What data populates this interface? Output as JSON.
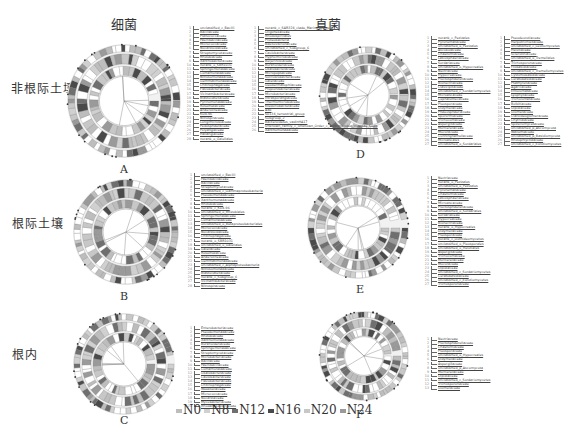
{
  "figure": {
    "column_titles": [
      "细菌",
      "真菌"
    ],
    "row_labels": [
      "非根际土壤",
      "根际土壤",
      "根内"
    ],
    "panels": [
      {
        "letter": "A",
        "row": 0,
        "col": 0,
        "legend_columns": [
          [
            "unclassified_c_Bacilli",
            "Bacillaceae",
            "Planococcaceae",
            "Paenibacillaceae",
            "Micrococcaceae",
            "Nocardioidaceae",
            "Streptomycetaceae",
            "Rhizobiaceae",
            "Xanthobacteraceae",
            "norank_o_SBR1031",
            "Sphingomonadaceae",
            "Comamonadaceae",
            "Nitrosomonadaceae",
            "Gemmatimonadaceae",
            "Chitinophagaceae",
            "Flavobacteriaceae",
            "Vicinamibacteraceae",
            "Blastocatellaceae",
            "Pyrinomonadaceae",
            "Roseiflexaceae",
            "Anaerolineaceae",
            "KD4-96",
            "Nitrospiraceae",
            "Longimicrobiaceae",
            "Pedosphaeraceae",
            "Polyangiaceae",
            "Haliangiaceae",
            "norank_o_Gaiellales"
          ],
          [
            "norank_c_SAR324_clade_Marine_group_B",
            "Oligoflexaceae",
            "Rhodospirillales",
            "Proteobacteria",
            "Bdellovibrionaceae",
            "unclassified_c_Subgroup_6",
            "Caulobacteraceae",
            "Hyphomicrobiaceae",
            "Beijerinckiaceae",
            "Burkholderiaceae",
            "Oxalobacteraceae",
            "Micropepsaceae",
            "Solirubrobacteraceae",
            "Gaiellaceae",
            "Geodermatophilaceae",
            "Propionibacteriaceae",
            "Microbacteriaceae",
            "Intrasporangiaceae",
            "Thermomicrobiaceae",
            "Ktedonobacteraceae",
            "A4b",
            "S0134_terrestrial_group",
            "Subgroup_2",
            "Bacteroidetes_vadinHA17",
            "Unknown_Family_c_Unknown_Order_c_Tectomicrobia_Incertae_Sedis",
            "Xanthomonadaceae"
          ]
        ]
      },
      {
        "letter": "B",
        "row": 1,
        "col": 0,
        "legend_columns": [
          [
            "unclassified_c_Bacilli",
            "Paenibacillaceae",
            "Bacillaceae",
            "Streptomycetaceae",
            "unclassified_c_Gammaproteobacteria",
            "Pseudomonadaceae",
            "Xanthomonadaceae",
            "Rhizobiaceae",
            "norank_c_KD4-96",
            "unclassified_o_Rhizobiales",
            "Sphingomonadaceae",
            "Comamonadaceae",
            "unclassified_o_Betaproteobacteriales",
            "Micrococcaceae",
            "Nocardioidaceae",
            "Chitinophagaceae",
            "norank_o_SBR1031",
            "unclassified_o_Gaiellales",
            "Gaiellaceae",
            "Roseiflexaceae",
            "Anaerolineaceae",
            "Gemmatimonadaceae",
            "unclassified_c_Alphaproteobacteria",
            "Nitrosomonadaceae",
            "Blastocatellaceae",
            "norank_c_Subgroup_6",
            "Vicinamibacteraceae",
            "Nitrospiraceae"
          ]
        ]
      },
      {
        "letter": "C",
        "row": 2,
        "col": 0,
        "legend_columns": [
          [
            "Enterobacteriaceae",
            "Pseudomonadaceae",
            "Rhizobiaceae",
            "Xanthomonadaceae",
            "Burkholderiaceae",
            "Sphingomonadaceae",
            "Streptomycetaceae",
            "Microbacteriaceae",
            "Bacillaceae",
            "Paenibacillaceae",
            "Comamonadaceae",
            "Oxalobacteraceae",
            "Caulobacteraceae",
            "Flavobacteriaceae",
            "Chitinophagaceae",
            "Weeksellaceae",
            "Micrococcaceae",
            "Nocardiaceae",
            "Mycobacteriaceae",
            "Rhodanobacteraceae"
          ]
        ]
      },
      {
        "letter": "D",
        "row": 0,
        "col": 1,
        "legend_columns": [
          [
            "norank_c_Pezizales",
            "Pyronemataceae",
            "unclassified_o_Pezizales",
            "Ascobolaceae",
            "Chaetomiaceae",
            "Lasiosphaeriaceae",
            "Sordariaceae",
            "unclassified_o_Hypocreales",
            "Nectriaceae",
            "Hypocreaceae",
            "Plectosphaerellaceae",
            "Bionectriaceae",
            "Clavicipitaceae",
            "unclassified_c_Sordariomycetes",
            "Microascaceae",
            "Cephalothecaceae",
            "Pleosporaceae",
            "Didymellaceae",
            "Phaeosphaeriaceae",
            "Sporormiaceae",
            "Trichocomaceae",
            "Aspergillaceae",
            "Mortierellaceae",
            "Mucoraceae",
            "Cunninghamellaceae",
            "Microascales",
            "unclassified_o_Sordariales"
          ],
          [
            "Pseudeurotiaceae",
            "Herpotrichiellaceae",
            "unclassified_c_Leotiomycetes",
            "Helotiaceae",
            "Sclerotiniaceae",
            "unclassified_o_Tremellales",
            "Trichosporonaceae",
            "Filobasidiaceae",
            "unclassified_c_Tremellomycetes",
            "Cystofilobasidiaceae",
            "Ceratobasidiaceae",
            "Psathyrellaceae",
            "Agaricaceae",
            "Entolomataceae",
            "Lyophyllaceae",
            "Tricholomataceae",
            "Bolbitiaceae",
            "Olpidiaceae",
            "Glomeraceae",
            "Claroideoglomeraceae",
            "Chytridiaceae",
            "Spizellomycetaceae",
            "unclassified_p_Ascomycota",
            "Wallemiaceae",
            "unclassified_p_Basidiomycota",
            "Rhizophlyctidaceae",
            "unclassified_c_Eurotiomycetes"
          ]
        ]
      },
      {
        "letter": "E",
        "row": 1,
        "col": 1,
        "legend_columns": [
          [
            "Nectriaceae",
            "norank_o_Pezizales",
            "unclassified_o_Pezizales",
            "Pyronemataceae",
            "Chaetomiaceae",
            "Lasiosphaeriaceae",
            "Microascaceae",
            "Plectosphaerellaceae",
            "unclassified_o_Sordariales",
            "Sordariaceae",
            "Hypocreaceae",
            "Bionectriaceae",
            "norank_o_Hypocreales",
            "Didymellaceae",
            "Pleosporaceae",
            "norank_c_Dothideomycetes",
            "unclassified_o_Pleosporales",
            "unclassified_o_Helotiales",
            "Aspergillaceae",
            "Trichocomaceae",
            "Mortierellaceae",
            "Mucoraceae",
            "Olpidiaceae",
            "unclassified_c_Sordariomycetes",
            "Ceratobasidiaceae",
            "unclassified_c_Eurotiomycetes",
            "Trichosporonaceae"
          ]
        ]
      },
      {
        "letter": "F",
        "row": 2,
        "col": 1,
        "legend_columns": [
          [
            "Nectriaceae",
            "Plectosphaerellaceae",
            "Chaetomiaceae",
            "Pleosporaceae",
            "unclassified_o_Hypocreales",
            "Didymellaceae",
            "Aspergillaceae",
            "unclassified_p_Ascomycota",
            "Mortierellaceae",
            "Olpidiaceae",
            "unclassified_c_Sordariomycetes",
            "Trichosporonaceae",
            "Glomeraceae"
          ]
        ]
      }
    ],
    "group_legend": [
      {
        "label": "N0",
        "color": "#bdbdbd"
      },
      {
        "label": "N8",
        "color": "#d0d0d0"
      },
      {
        "label": "N12",
        "color": "#6f6f6f"
      },
      {
        "label": "N16",
        "color": "#4a4a4a"
      },
      {
        "label": "N20",
        "color": "#c7c7c7"
      },
      {
        "label": "N24",
        "color": "#9a9a9a"
      }
    ]
  }
}
